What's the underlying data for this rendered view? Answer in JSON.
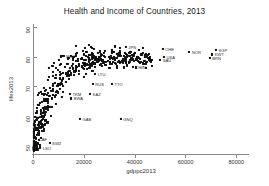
{
  "chart_data": {
    "type": "scatter",
    "title": "Health and Income of Countries, 2013",
    "xlabel": "gdppc2013",
    "ylabel": "lifex2013",
    "xlim": [
      0,
      85000
    ],
    "ylim": [
      47,
      91
    ],
    "xticks": [
      0,
      20000,
      40000,
      60000,
      80000
    ],
    "xticklabels": [
      "0",
      "20000",
      "40000",
      "60000",
      "80000"
    ],
    "yticks": [
      50,
      60,
      70,
      80,
      90
    ],
    "yticklabels": [
      "50",
      "60",
      "70",
      "80",
      "90"
    ],
    "grid": false,
    "legend": false,
    "marker": "filled-square",
    "marker_color": "#111111",
    "points": [
      {
        "label": "SGP",
        "x": 72000,
        "y": 82.3
      },
      {
        "label": "KWT",
        "x": 70500,
        "y": 80.7
      },
      {
        "label": "BRN",
        "x": 69500,
        "y": 79.5
      },
      {
        "label": "NOR",
        "x": 61500,
        "y": 81.6
      },
      {
        "label": "CHE",
        "x": 51000,
        "y": 82.6
      },
      {
        "label": "USA",
        "x": 51500,
        "y": 79.8
      },
      {
        "label": "SAU",
        "x": 50000,
        "y": 78.9
      },
      {
        "label": "OMN",
        "x": 39500,
        "y": 76.4
      },
      {
        "label": "GNQ",
        "x": 34500,
        "y": 58.8
      },
      {
        "label": "TTO",
        "x": 31000,
        "y": 70.6
      },
      {
        "label": "JPN",
        "x": 36500,
        "y": 83.3
      },
      {
        "label": "KAZ",
        "x": 22500,
        "y": 67.4
      },
      {
        "label": "RUS",
        "x": 23500,
        "y": 70.8
      },
      {
        "label": "LTU",
        "x": 24500,
        "y": 74.1
      },
      {
        "label": "TKM",
        "x": 14500,
        "y": 67.3
      },
      {
        "label": "BWA",
        "x": 15000,
        "y": 65.8
      },
      {
        "label": "GAB",
        "x": 18500,
        "y": 59.0
      },
      {
        "label": "CAF",
        "x": 1200,
        "y": 52.2
      },
      {
        "label": "SWZ",
        "x": 6500,
        "y": 50.6
      },
      {
        "label": "LSO",
        "x": 2800,
        "y": 49.2
      },
      {
        "label": "MCO",
        "x": 12000,
        "y": 80.3
      }
    ],
    "cluster_note": "Dense unlabeled cluster of countries at low-to-mid GDP with life expectancy 55-82"
  }
}
